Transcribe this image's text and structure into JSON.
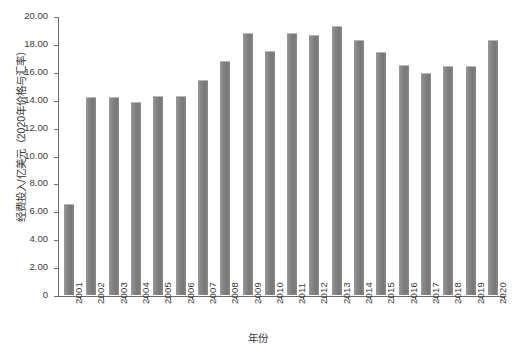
{
  "chart_data": {
    "type": "bar",
    "title": "",
    "xlabel": "年份",
    "ylabel": "经费投入/亿美元（2020年价格与汇率）",
    "categories": [
      "2001",
      "2002",
      "2003",
      "2004",
      "2005",
      "2006",
      "2007",
      "2008",
      "2009",
      "2010",
      "2011",
      "2012",
      "2013",
      "2014",
      "2015",
      "2016",
      "2017",
      "2018",
      "2019",
      "2020"
    ],
    "values": [
      6.5,
      14.2,
      14.2,
      13.85,
      14.3,
      14.3,
      15.4,
      16.75,
      18.75,
      17.5,
      18.8,
      18.65,
      19.25,
      18.3,
      17.4,
      16.5,
      15.9,
      16.4,
      16.45,
      18.25
    ],
    "ylim": [
      0,
      20
    ],
    "ytick_values": [
      0,
      2,
      4,
      6,
      8,
      10,
      12,
      14,
      16,
      18,
      20
    ],
    "ytick_labels": [
      "0",
      "2.00",
      "4.00",
      "6.00",
      "8.00",
      "10.00",
      "12.00",
      "14.00",
      "16.00",
      "18.00",
      "20.00"
    ],
    "grid": false,
    "legend": false,
    "bar_color": "#808080",
    "axis_color": "#6d6d6d",
    "background_color": "#ffffff"
  }
}
